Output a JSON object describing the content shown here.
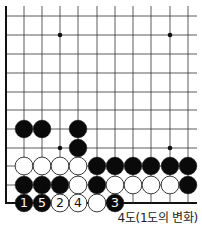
{
  "diagram": {
    "title": "4도(1도의 변화)",
    "board": {
      "columns_x": [
        6,
        24,
        42,
        60,
        78,
        97,
        115,
        133,
        151,
        170,
        188
      ],
      "rows_y": [
        16,
        35,
        54,
        73,
        92,
        110,
        129,
        148,
        166,
        185,
        203
      ],
      "line_extent": {
        "x_min": 6,
        "x_max": 197,
        "y_min": 6,
        "y_max": 203
      },
      "edges": {
        "left": true,
        "bottom": true,
        "top": false,
        "right": false
      },
      "star_points": [
        {
          "col": 3,
          "row": 1
        },
        {
          "col": 9,
          "row": 1
        },
        {
          "col": 3,
          "row": 7
        },
        {
          "col": 9,
          "row": 7
        }
      ],
      "stones": [
        {
          "col": 1,
          "row": 6,
          "color": "black"
        },
        {
          "col": 2,
          "row": 6,
          "color": "black"
        },
        {
          "col": 4,
          "row": 6,
          "color": "black"
        },
        {
          "col": 4,
          "row": 7,
          "color": "black"
        },
        {
          "col": 1,
          "row": 8,
          "color": "white"
        },
        {
          "col": 2,
          "row": 8,
          "color": "white"
        },
        {
          "col": 3,
          "row": 8,
          "color": "white"
        },
        {
          "col": 4,
          "row": 8,
          "color": "white"
        },
        {
          "col": 5,
          "row": 8,
          "color": "black"
        },
        {
          "col": 6,
          "row": 8,
          "color": "black"
        },
        {
          "col": 7,
          "row": 8,
          "color": "black"
        },
        {
          "col": 8,
          "row": 8,
          "color": "black"
        },
        {
          "col": 9,
          "row": 8,
          "color": "black"
        },
        {
          "col": 10,
          "row": 8,
          "color": "black"
        },
        {
          "col": 1,
          "row": 9,
          "color": "black"
        },
        {
          "col": 2,
          "row": 9,
          "color": "black"
        },
        {
          "col": 3,
          "row": 9,
          "color": "black"
        },
        {
          "col": 4,
          "row": 9,
          "color": "white"
        },
        {
          "col": 5,
          "row": 9,
          "color": "black"
        },
        {
          "col": 6,
          "row": 9,
          "color": "white"
        },
        {
          "col": 7,
          "row": 9,
          "color": "white"
        },
        {
          "col": 8,
          "row": 9,
          "color": "white"
        },
        {
          "col": 9,
          "row": 9,
          "color": "white"
        },
        {
          "col": 10,
          "row": 9,
          "color": "black"
        },
        {
          "col": 1,
          "row": 10,
          "color": "black",
          "label": "1"
        },
        {
          "col": 2,
          "row": 10,
          "color": "black",
          "label": "5"
        },
        {
          "col": 3,
          "row": 10,
          "color": "white",
          "label": "2"
        },
        {
          "col": 4,
          "row": 10,
          "color": "white",
          "label": "4"
        },
        {
          "col": 5,
          "row": 10,
          "color": "white"
        },
        {
          "col": 6,
          "row": 10,
          "color": "black",
          "label": "3"
        }
      ],
      "colors": {
        "line": "#333333",
        "edge": "#111111",
        "black": "#0a0a0a",
        "white": "#ffffff",
        "stone_outline": "#222222"
      }
    }
  }
}
